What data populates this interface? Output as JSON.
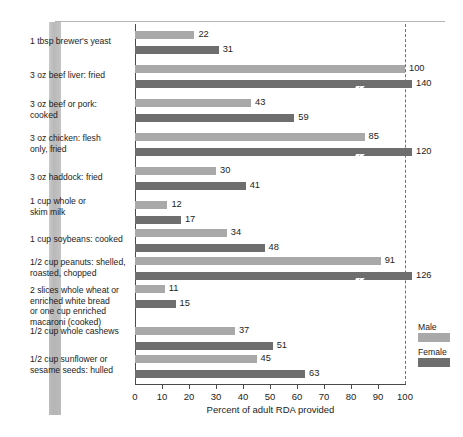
{
  "chart_data": {
    "type": "bar",
    "orientation": "horizontal",
    "title": "",
    "xlabel": "Percent of adult RDA provided",
    "ylabel": "",
    "xlim": [
      0,
      100
    ],
    "xticks": [
      0,
      10,
      20,
      30,
      40,
      50,
      60,
      70,
      80,
      90,
      100
    ],
    "grid": false,
    "legend_position": "right",
    "reference_line": {
      "value": 100,
      "style": "dashed"
    },
    "note": "Bars extending past 100 are drawn broken with a lightning-bolt mark",
    "categories": [
      "1 tbsp brewer's yeast",
      "3 oz beef liver:  fried",
      "3 oz beef or pork:\ncooked",
      "3 oz chicken:  flesh\nonly, fried",
      "3 oz haddock:  fried",
      "1 cup whole or\nskim milk",
      "1 cup soybeans:  cooked",
      "1/2 cup peanuts: shelled,\nroasted, chopped",
      "2 slices whole wheat or\nenriched white bread\nor one cup enriched\nmacaroni (cooked)",
      "1/2 cup whole cashews",
      "1/2 cup sunflower or\nsesame seeds:  hulled"
    ],
    "series": [
      {
        "name": "Male",
        "color": "#a9a9a9",
        "values": [
          22,
          100,
          43,
          85,
          30,
          12,
          34,
          91,
          11,
          37,
          45
        ]
      },
      {
        "name": "Female",
        "color": "#6e6e6e",
        "values": [
          31,
          140,
          59,
          120,
          41,
          17,
          48,
          126,
          15,
          51,
          63
        ]
      }
    ]
  },
  "legend": {
    "male_label": "Male",
    "female_label": "Female"
  },
  "axis": {
    "title": "Percent of adult RDA provided",
    "tick_labels": [
      "0",
      "10",
      "20",
      "30",
      "40",
      "50",
      "60",
      "70",
      "80",
      "90",
      "100"
    ]
  }
}
